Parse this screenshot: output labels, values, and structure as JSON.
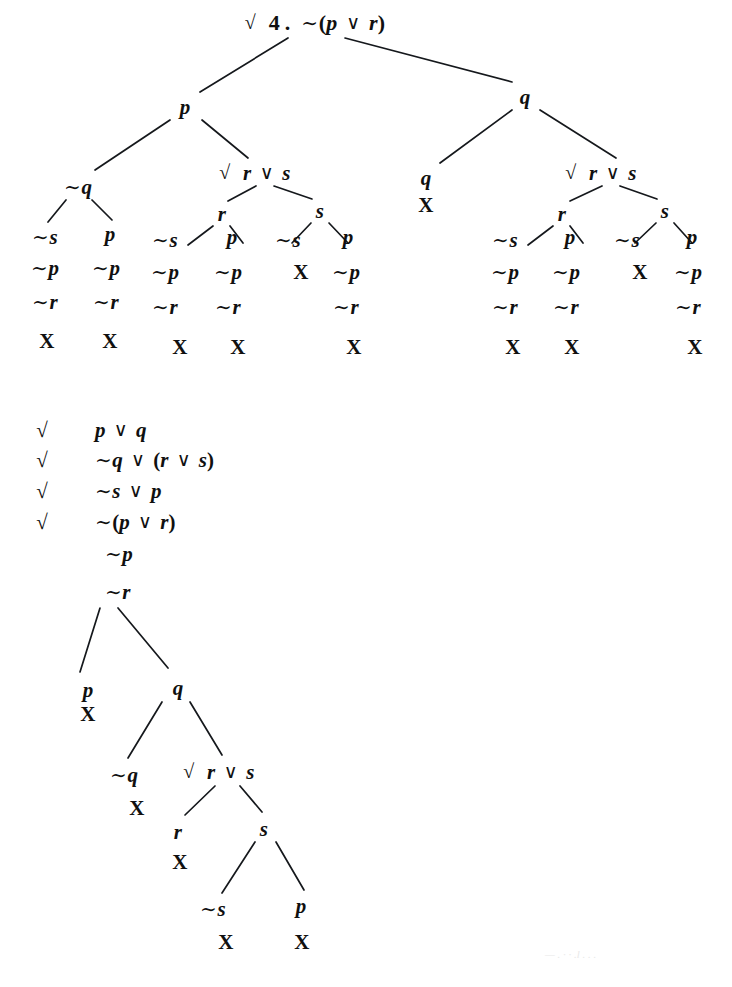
{
  "page": {
    "width": 732,
    "height": 987,
    "background": "#ffffff",
    "ink": "#101010",
    "bleed_text": "— . · · .l . . ."
  },
  "symbols": {
    "negation": "∼",
    "disjunction": "∨",
    "check": "√",
    "close": "X",
    "open_paren": "(",
    "close_paren": ")"
  },
  "tree_one": {
    "label": "4",
    "root": {
      "id": "t1-root",
      "text": "√ 4. ∼(p ∨ r)",
      "checked": true,
      "number": "4.",
      "formula": "∼(p ∨ r)",
      "x": 315,
      "y": 23
    },
    "nodes": [
      {
        "id": "t1-p",
        "text": "p",
        "x": 185,
        "y": 107
      },
      {
        "id": "t1-q",
        "text": "q",
        "x": 525,
        "y": 97
      },
      {
        "id": "t1-nq",
        "text": "∼q",
        "x": 78,
        "y": 187
      },
      {
        "id": "t1-rvs-l",
        "text": "√ r ∨ s",
        "checked": true,
        "x": 255,
        "y": 173
      },
      {
        "id": "t1-q2",
        "text": "q",
        "x": 426,
        "y": 178
      },
      {
        "id": "t1-q2-x",
        "text": "X",
        "x": 426,
        "y": 205,
        "close": true
      },
      {
        "id": "t1-rvs-r",
        "text": "√ r ∨ s",
        "checked": true,
        "x": 601,
        "y": 173
      },
      {
        "id": "t1-r-l",
        "text": "r",
        "x": 222,
        "y": 214
      },
      {
        "id": "t1-s-l",
        "text": "s",
        "x": 320,
        "y": 211
      },
      {
        "id": "t1-r-r",
        "text": "r",
        "x": 562,
        "y": 214
      },
      {
        "id": "t1-s-r",
        "text": "s",
        "x": 665,
        "y": 211
      },
      {
        "id": "t1-c1-a",
        "text": "∼s",
        "x": 45,
        "y": 237
      },
      {
        "id": "t1-c1-b",
        "text": "∼p",
        "x": 45,
        "y": 268
      },
      {
        "id": "t1-c1-c",
        "text": "∼r",
        "x": 45,
        "y": 302
      },
      {
        "id": "t1-c1-x",
        "text": "X",
        "x": 47,
        "y": 341,
        "close": true
      },
      {
        "id": "t1-c2-a",
        "text": "p",
        "x": 110,
        "y": 234
      },
      {
        "id": "t1-c2-b",
        "text": "∼p",
        "x": 106,
        "y": 268
      },
      {
        "id": "t1-c2-c",
        "text": "∼r",
        "x": 106,
        "y": 302
      },
      {
        "id": "t1-c2-x",
        "text": "X",
        "x": 110,
        "y": 341,
        "close": true
      },
      {
        "id": "t1-c3-a",
        "text": "∼s",
        "x": 165,
        "y": 240
      },
      {
        "id": "t1-c3-b",
        "text": "∼p",
        "x": 165,
        "y": 272
      },
      {
        "id": "t1-c3-c",
        "text": "∼r",
        "x": 165,
        "y": 307
      },
      {
        "id": "t1-c3-x",
        "text": "X",
        "x": 180,
        "y": 347,
        "close": true
      },
      {
        "id": "t1-c4-a",
        "text": "p",
        "x": 232,
        "y": 237
      },
      {
        "id": "t1-c4-b",
        "text": "∼p",
        "x": 228,
        "y": 272
      },
      {
        "id": "t1-c4-c",
        "text": "∼r",
        "x": 228,
        "y": 307
      },
      {
        "id": "t1-c4-x",
        "text": "X",
        "x": 238,
        "y": 347,
        "close": true
      },
      {
        "id": "t1-c5-a",
        "text": "∼s",
        "x": 288,
        "y": 240
      },
      {
        "id": "t1-c5-x",
        "text": "X",
        "x": 301,
        "y": 272,
        "close": true
      },
      {
        "id": "t1-c6-a",
        "text": "p",
        "x": 348,
        "y": 237
      },
      {
        "id": "t1-c6-b",
        "text": "∼p",
        "x": 346,
        "y": 272
      },
      {
        "id": "t1-c6-c",
        "text": "∼r",
        "x": 346,
        "y": 307
      },
      {
        "id": "t1-c6-x",
        "text": "X",
        "x": 354,
        "y": 347,
        "close": true
      },
      {
        "id": "t1-c7-a",
        "text": "∼s",
        "x": 505,
        "y": 240
      },
      {
        "id": "t1-c7-b",
        "text": "∼p",
        "x": 505,
        "y": 272
      },
      {
        "id": "t1-c7-c",
        "text": "∼r",
        "x": 505,
        "y": 307
      },
      {
        "id": "t1-c7-x",
        "text": "X",
        "x": 513,
        "y": 347,
        "close": true
      },
      {
        "id": "t1-c8-a",
        "text": "p",
        "x": 570,
        "y": 237
      },
      {
        "id": "t1-c8-b",
        "text": "∼p",
        "x": 566,
        "y": 272
      },
      {
        "id": "t1-c8-c",
        "text": "∼r",
        "x": 566,
        "y": 307
      },
      {
        "id": "t1-c8-x",
        "text": "X",
        "x": 572,
        "y": 347,
        "close": true
      },
      {
        "id": "t1-c9-a",
        "text": "∼s",
        "x": 627,
        "y": 240
      },
      {
        "id": "t1-c9-x",
        "text": "X",
        "x": 640,
        "y": 272,
        "close": true
      },
      {
        "id": "t1-c10-a",
        "text": "p",
        "x": 692,
        "y": 237
      },
      {
        "id": "t1-c10-b",
        "text": "∼p",
        "x": 688,
        "y": 272
      },
      {
        "id": "t1-c10-c",
        "text": "∼r",
        "x": 688,
        "y": 307
      },
      {
        "id": "t1-c10-x",
        "text": "X",
        "x": 695,
        "y": 347,
        "close": true
      }
    ],
    "edges": [
      {
        "x1": 288,
        "y1": 38,
        "x2": 200,
        "y2": 92
      },
      {
        "x1": 345,
        "y1": 38,
        "x2": 512,
        "y2": 82
      },
      {
        "x1": 170,
        "y1": 120,
        "x2": 95,
        "y2": 170
      },
      {
        "x1": 202,
        "y1": 120,
        "x2": 248,
        "y2": 158
      },
      {
        "x1": 512,
        "y1": 110,
        "x2": 440,
        "y2": 163
      },
      {
        "x1": 540,
        "y1": 110,
        "x2": 616,
        "y2": 158
      },
      {
        "x1": 66,
        "y1": 200,
        "x2": 48,
        "y2": 222
      },
      {
        "x1": 92,
        "y1": 200,
        "x2": 112,
        "y2": 220
      },
      {
        "x1": 256,
        "y1": 186,
        "x2": 228,
        "y2": 201
      },
      {
        "x1": 274,
        "y1": 186,
        "x2": 312,
        "y2": 199
      },
      {
        "x1": 602,
        "y1": 186,
        "x2": 570,
        "y2": 201
      },
      {
        "x1": 620,
        "y1": 186,
        "x2": 657,
        "y2": 199
      },
      {
        "x1": 213,
        "y1": 226,
        "x2": 188,
        "y2": 245
      },
      {
        "x1": 230,
        "y1": 226,
        "x2": 243,
        "y2": 243
      },
      {
        "x1": 311,
        "y1": 223,
        "x2": 292,
        "y2": 243
      },
      {
        "x1": 329,
        "y1": 223,
        "x2": 348,
        "y2": 243
      },
      {
        "x1": 553,
        "y1": 226,
        "x2": 528,
        "y2": 245
      },
      {
        "x1": 570,
        "y1": 226,
        "x2": 583,
        "y2": 243
      },
      {
        "x1": 656,
        "y1": 223,
        "x2": 635,
        "y2": 243
      },
      {
        "x1": 674,
        "y1": 223,
        "x2": 692,
        "y2": 243
      }
    ]
  },
  "premises": {
    "check_x": 42,
    "rows": [
      {
        "id": "pr-1",
        "checked": true,
        "text": "p ∨ q",
        "x": 95,
        "y": 430
      },
      {
        "id": "pr-2",
        "checked": true,
        "text": "∼q ∨ (r ∨ s)",
        "x": 95,
        "y": 460
      },
      {
        "id": "pr-3",
        "checked": true,
        "text": "∼s ∨ p",
        "x": 95,
        "y": 491
      },
      {
        "id": "pr-4",
        "checked": true,
        "text": "∼(p ∨ r)",
        "x": 95,
        "y": 522
      },
      {
        "id": "pr-5",
        "checked": false,
        "text": "∼p",
        "x": 105,
        "y": 554
      },
      {
        "id": "pr-6",
        "checked": false,
        "text": "∼r",
        "x": 105,
        "y": 592
      }
    ]
  },
  "tree_two": {
    "nodes": [
      {
        "id": "t2-p",
        "text": "p",
        "x": 88,
        "y": 690
      },
      {
        "id": "t2-p-x",
        "text": "X",
        "x": 88,
        "y": 714,
        "close": true
      },
      {
        "id": "t2-q",
        "text": "q",
        "x": 178,
        "y": 688
      },
      {
        "id": "t2-nq",
        "text": "∼q",
        "x": 124,
        "y": 775
      },
      {
        "id": "t2-nq-x",
        "text": "X",
        "x": 137,
        "y": 808,
        "close": true
      },
      {
        "id": "t2-rvs",
        "text": "√ r ∨ s",
        "checked": true,
        "x": 219,
        "y": 772
      },
      {
        "id": "t2-r",
        "text": "r",
        "x": 178,
        "y": 832
      },
      {
        "id": "t2-r-x",
        "text": "X",
        "x": 180,
        "y": 862,
        "close": true
      },
      {
        "id": "t2-s",
        "text": "s",
        "x": 264,
        "y": 829
      },
      {
        "id": "t2-ns",
        "text": "∼s",
        "x": 213,
        "y": 909
      },
      {
        "id": "t2-ns-x",
        "text": "X",
        "x": 226,
        "y": 942,
        "close": true
      },
      {
        "id": "t2-p2",
        "text": "p",
        "x": 301,
        "y": 906
      },
      {
        "id": "t2-p2-x",
        "text": "X",
        "x": 302,
        "y": 942,
        "close": true
      }
    ],
    "edges": [
      {
        "x1": 100,
        "y1": 608,
        "x2": 80,
        "y2": 672
      },
      {
        "x1": 118,
        "y1": 608,
        "x2": 168,
        "y2": 668
      },
      {
        "x1": 162,
        "y1": 702,
        "x2": 128,
        "y2": 758
      },
      {
        "x1": 190,
        "y1": 702,
        "x2": 222,
        "y2": 755
      },
      {
        "x1": 215,
        "y1": 786,
        "x2": 185,
        "y2": 815
      },
      {
        "x1": 240,
        "y1": 786,
        "x2": 262,
        "y2": 812
      },
      {
        "x1": 255,
        "y1": 842,
        "x2": 222,
        "y2": 893
      },
      {
        "x1": 276,
        "y1": 842,
        "x2": 304,
        "y2": 890
      }
    ]
  }
}
